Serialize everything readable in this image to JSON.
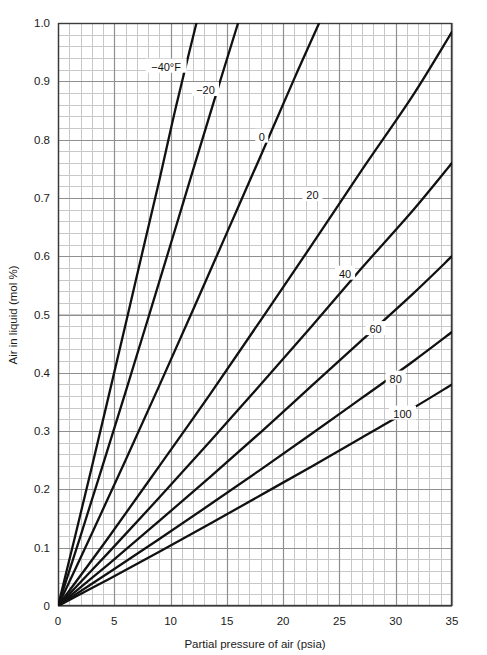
{
  "chart_data": {
    "type": "line",
    "title": "",
    "xlabel": "Partial pressure of air (psia)",
    "ylabel": "Air in liquid (mol %)",
    "xlim": [
      0,
      35
    ],
    "ylim": [
      0,
      1.0
    ],
    "xticks": [
      0,
      5,
      10,
      15,
      20,
      25,
      30,
      35
    ],
    "xtick_labels": [
      "0",
      "5",
      "10",
      "15",
      "20",
      "25",
      "30",
      "35"
    ],
    "yticks": [
      0,
      0.1,
      0.2,
      0.3,
      0.4,
      0.5,
      0.6,
      0.7,
      0.8,
      0.9,
      1.0
    ],
    "ytick_labels": [
      "0",
      "0.1",
      "0.2",
      "0.3",
      "0.4",
      "0.5",
      "0.6",
      "0.7",
      "0.8",
      "0.9",
      "1.0"
    ],
    "grid": "major-and-minor",
    "minor_per_major_x": 5,
    "minor_per_major_y": 5,
    "legend_position": "inline-labels",
    "legend_note": "Each curve is labeled inline with its isotherm temperature in degrees Fahrenheit",
    "series": [
      {
        "name": "-40",
        "label": "−40°F",
        "label_x": 9.6,
        "label_y": 0.925,
        "x": [
          0,
          1.5,
          3.0,
          4.5,
          6.0,
          7.5,
          9.0,
          10.5,
          12.3
        ],
        "values": [
          0,
          0.118,
          0.238,
          0.36,
          0.483,
          0.607,
          0.73,
          0.858,
          1.0
        ]
      },
      {
        "name": "-20",
        "label": "−20",
        "label_x": 13.1,
        "label_y": 0.885,
        "x": [
          0,
          2.0,
          4.0,
          6.0,
          8.0,
          10.0,
          12.0,
          14.0,
          16.0
        ],
        "values": [
          0,
          0.12,
          0.243,
          0.367,
          0.493,
          0.62,
          0.748,
          0.875,
          1.0
        ]
      },
      {
        "name": "0",
        "label": "0",
        "label_x": 18.1,
        "label_y": 0.805,
        "x": [
          0,
          3.0,
          6.0,
          9.0,
          12.0,
          15.0,
          18.0,
          21.0,
          23.2
        ],
        "values": [
          0,
          0.124,
          0.25,
          0.378,
          0.508,
          0.64,
          0.772,
          0.905,
          1.0
        ]
      },
      {
        "name": "20",
        "label": "20",
        "label_x": 22.6,
        "label_y": 0.705,
        "x": [
          0,
          4.5,
          9.0,
          13.5,
          18.0,
          22.5,
          27.0,
          31.5,
          35.0
        ],
        "values": [
          0,
          0.118,
          0.24,
          0.363,
          0.49,
          0.618,
          0.748,
          0.875,
          0.985
        ]
      },
      {
        "name": "40",
        "label": "40",
        "label_x": 25.5,
        "label_y": 0.57,
        "x": [
          0,
          4.5,
          9.0,
          13.5,
          18.0,
          22.5,
          27.0,
          31.5,
          35.0
        ],
        "values": [
          0,
          0.092,
          0.186,
          0.282,
          0.38,
          0.479,
          0.58,
          0.678,
          0.76
        ]
      },
      {
        "name": "60",
        "label": "60",
        "label_x": 28.2,
        "label_y": 0.475,
        "x": [
          0,
          4.5,
          9.0,
          13.5,
          18.0,
          22.5,
          27.0,
          31.5,
          35.0
        ],
        "values": [
          0,
          0.072,
          0.146,
          0.221,
          0.298,
          0.377,
          0.456,
          0.535,
          0.6
        ]
      },
      {
        "name": "80",
        "label": "80",
        "label_x": 30.0,
        "label_y": 0.39,
        "x": [
          0,
          4.5,
          9.0,
          13.5,
          18.0,
          22.5,
          27.0,
          31.5,
          35.0
        ],
        "values": [
          0,
          0.057,
          0.115,
          0.174,
          0.234,
          0.295,
          0.357,
          0.419,
          0.47
        ]
      },
      {
        "name": "100",
        "label": "100",
        "label_x": 30.6,
        "label_y": 0.33,
        "x": [
          0,
          4.5,
          9.0,
          13.5,
          18.0,
          22.5,
          27.0,
          31.5,
          35.0
        ],
        "values": [
          0,
          0.046,
          0.093,
          0.141,
          0.19,
          0.239,
          0.289,
          0.339,
          0.38
        ]
      }
    ]
  },
  "style": {
    "curve_color": "#111111",
    "major_grid_color": "#8f8f8f",
    "minor_grid_color": "#c8c8c8",
    "frame_color": "#3a3a3a",
    "text_color": "#1a1a1a",
    "background": "#ffffff"
  },
  "plot_box": {
    "left": 58,
    "top": 23,
    "right": 452,
    "bottom": 606
  }
}
